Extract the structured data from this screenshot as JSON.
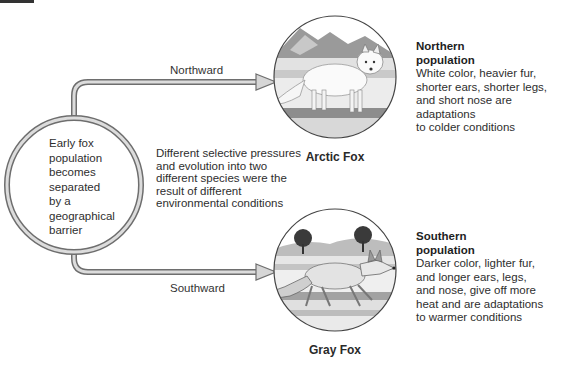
{
  "diagram": {
    "source": {
      "lines": [
        "Early fox",
        "population",
        "becomes",
        "separated",
        "by a",
        "geographical",
        "barrier"
      ]
    },
    "arrows": {
      "north_label": "Northward",
      "south_label": "Southward"
    },
    "middle_note": {
      "lines": [
        "Different selective pressures",
        "and evolution into two",
        "different species were the",
        "result of different",
        "environmental conditions"
      ]
    },
    "northern": {
      "caption": "Arctic Fox",
      "heading_lines": [
        "Northern",
        "population"
      ],
      "body_lines": [
        "White color, heavier fur,",
        "shorter ears, shorter legs,",
        "and short nose are adaptations",
        "to colder conditions"
      ]
    },
    "southern": {
      "caption": "Gray Fox",
      "heading_lines": [
        "Southern",
        "population"
      ],
      "body_lines": [
        "Darker color, lighter fur,",
        "and longer ears, legs,",
        "and nose, give off more",
        "heat and are adaptations",
        "to warmer conditions"
      ]
    },
    "colors": {
      "outline": "#6e6e6e",
      "fill": "#d9d9d9",
      "text": "#2e2e2e"
    }
  }
}
